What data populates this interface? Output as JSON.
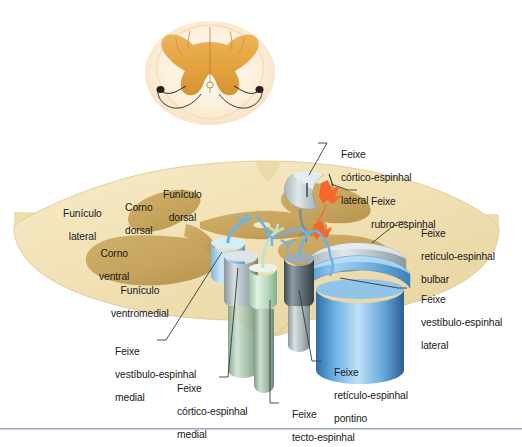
{
  "figure": {
    "language": "pt-BR"
  },
  "inset": {
    "name": "secao-transversal-medula",
    "description": "Corte histologico da medula espinhal em tons alaranjados"
  },
  "interior_labels": [
    {
      "id": "funiculo-lateral",
      "line1": "Funículo",
      "line2": "lateral"
    },
    {
      "id": "corno-dorsal",
      "line1": "Corno",
      "line2": "dorsal"
    },
    {
      "id": "funiculo-dorsal",
      "line1": "Funículo",
      "line2": "dorsal"
    },
    {
      "id": "corno-ventral",
      "line1": "Corno",
      "line2": "ventral"
    },
    {
      "id": "funiculo-ventromedial",
      "line1": "Funículo",
      "line2": "ventromedial"
    }
  ],
  "callouts": [
    {
      "id": "feixe-cortico-espinhal-lateral",
      "line1": "Feixe",
      "line2": "córtico-espinhal",
      "line3": "lateral",
      "color": "#9aa0a3"
    },
    {
      "id": "feixe-rubro-espinhal",
      "line1": "Feixe",
      "line2": "rubro-espinhal",
      "line3": "",
      "color": "#f4662a"
    },
    {
      "id": "feixe-reticulo-espinhal-bulbar",
      "line1": "Feixe",
      "line2": "retículo-espinhal",
      "line3": "bulbar",
      "color": "#b9c6cf"
    },
    {
      "id": "feixe-vestibulo-espinhal-lateral",
      "line1": "Feixe",
      "line2": "vestíbulo-espinhal",
      "line3": "lateral",
      "color": "#5fa8e0"
    },
    {
      "id": "feixe-vestibulo-espinhal-medial",
      "line1": "Feixe",
      "line2": "vestíbulo-espinhal",
      "line3": "medial",
      "color": "#a9d4f2"
    },
    {
      "id": "feixe-cortico-espinhal-medial",
      "line1": "Feixe",
      "line2": "córtico-espinhal",
      "line3": "medial",
      "color": "#9aa0a3"
    },
    {
      "id": "feixe-tecto-espinhal",
      "line1": "Feixe",
      "line2": "tecto-espinhal",
      "line3": "",
      "color": "#bfe0c4"
    },
    {
      "id": "feixe-reticulo-espinhal-pontino",
      "line1": "Feixe",
      "line2": "retículo-espinhal",
      "line3": "pontino",
      "color": "#5a6a73"
    }
  ],
  "palette": {
    "white_matter": "#f2e3b8",
    "white_matter_edge": "#e3cf9b",
    "grey_matter": "#c8a862",
    "rim": "#e8d6a4",
    "inset_orange": "#e6a33c",
    "inset_cream": "#fdf3e0",
    "blue_tract": "#5fa8e0",
    "blue_light": "#a9d4f2",
    "grey_tract": "#9aa0a3",
    "green_tract": "#bfe0c4",
    "dark_grey_tract": "#5a6a73",
    "red_tract": "#f4662a",
    "leader": "#3a3a3a",
    "rule": "#9aa8c4"
  }
}
